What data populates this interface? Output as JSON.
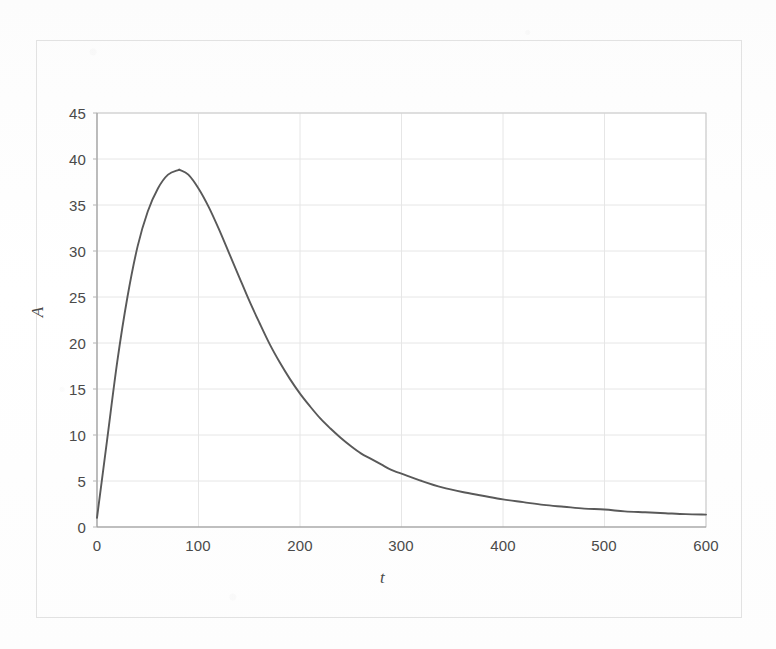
{
  "chart_data": {
    "type": "line",
    "title": "",
    "subtitle": "",
    "xlabel": "t",
    "ylabel": "A",
    "xlim": [
      0,
      600
    ],
    "ylim": [
      0,
      45
    ],
    "xticks": [
      0,
      100,
      200,
      300,
      400,
      500,
      600
    ],
    "yticks": [
      0,
      5,
      10,
      15,
      20,
      25,
      30,
      35,
      40,
      45
    ],
    "grid": true,
    "legend": null,
    "legend_position": "none",
    "series": [
      {
        "name": "A(t)",
        "color": "#595959",
        "x": [
          0,
          10,
          20,
          30,
          40,
          50,
          60,
          70,
          80,
          82,
          90,
          100,
          110,
          120,
          130,
          140,
          150,
          160,
          170,
          180,
          190,
          200,
          210,
          220,
          230,
          240,
          250,
          260,
          270,
          280,
          290,
          300,
          320,
          340,
          360,
          380,
          400,
          420,
          440,
          460,
          480,
          500,
          520,
          540,
          560,
          580,
          600
        ],
        "y": [
          1.0,
          9.5,
          18.0,
          25.0,
          30.5,
          34.3,
          36.8,
          38.3,
          38.8,
          38.8,
          38.3,
          36.8,
          34.8,
          32.4,
          29.8,
          27.2,
          24.6,
          22.2,
          19.9,
          17.9,
          16.1,
          14.5,
          13.1,
          11.8,
          10.7,
          9.7,
          8.8,
          8.0,
          7.4,
          6.8,
          6.2,
          5.8,
          5.0,
          4.3,
          3.8,
          3.4,
          3.0,
          2.7,
          2.4,
          2.2,
          2.0,
          1.9,
          1.7,
          1.6,
          1.5,
          1.4,
          1.35
        ]
      }
    ],
    "annotations": {
      "peak_value": 38.8,
      "peak_time": 82,
      "plateau_value": 1.35
    }
  },
  "axes": {
    "x_tick_labels": [
      "0",
      "100",
      "200",
      "300",
      "400",
      "500",
      "600"
    ],
    "y_tick_labels": [
      "0",
      "5",
      "10",
      "15",
      "20",
      "25",
      "30",
      "35",
      "40",
      "45"
    ],
    "x_axis_title": "t",
    "y_axis_title": "A"
  },
  "style": {
    "curve_color": "#595959",
    "grid_color": "#e6e6e6",
    "axis_color": "#b4b4b4",
    "frame_color": "#e2e2e2",
    "text_color": "#4a4a4a",
    "background": "#fefefe"
  }
}
